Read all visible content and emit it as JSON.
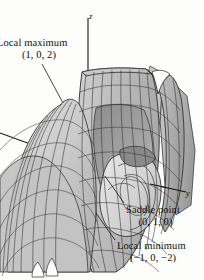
{
  "figure": {
    "kind": "surface-plot-3d",
    "background_color": "#fdfdfc",
    "ink_color": "#111111",
    "surface_fill_light": "#d8d8d8",
    "surface_fill_mid": "#b9b9b9",
    "surface_fill_dark": "#8f8f8f",
    "mesh_line_color": "#2e2e2e"
  },
  "axes": {
    "z": {
      "label": "z"
    },
    "y": {
      "label": "y"
    },
    "x": {
      "label": ""
    }
  },
  "annotations": [
    {
      "name": "local-maximum",
      "label": "Local maximum",
      "coordinates": "(1, 0, 2)",
      "point": {
        "x": 1,
        "y": 0,
        "z": 2
      }
    },
    {
      "name": "saddle-point",
      "label": "Saddle point",
      "coordinates": "(0, 1, 0)",
      "point": {
        "x": 0,
        "y": 1,
        "z": 0
      }
    },
    {
      "name": "local-minimum",
      "label": "Local minimum",
      "coordinates": "(−1, 0, −2)",
      "point": {
        "x": -1,
        "y": 0,
        "z": -2
      }
    }
  ]
}
